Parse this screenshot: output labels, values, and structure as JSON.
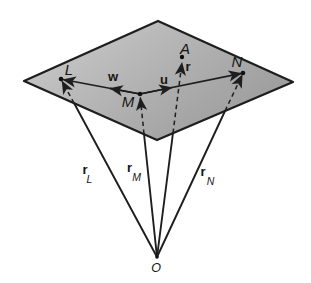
{
  "figure": {
    "point_labels": {
      "L": "L",
      "M": "M",
      "N": "N",
      "A": "A",
      "O": "O"
    },
    "vector_labels": {
      "w": "w",
      "u": "u",
      "r": "r"
    },
    "position_vector_labels": {
      "rL": {
        "base": "r",
        "sub": "L"
      },
      "rM": {
        "base": "r",
        "sub": "M"
      },
      "rN": {
        "base": "r",
        "sub": "N"
      }
    },
    "colors": {
      "plane_fill_light": "#cacaca",
      "plane_fill_dark": "#989898",
      "line": "#1e1e1e",
      "background": "#ffffff"
    }
  }
}
